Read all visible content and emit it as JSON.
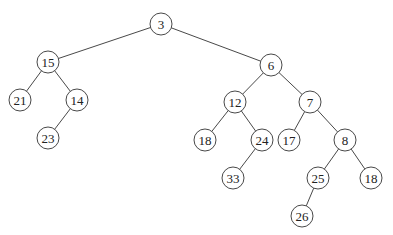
{
  "diagram": {
    "type": "binary-tree",
    "node_radius": 11,
    "nodes": [
      {
        "id": "n3",
        "label": "3",
        "x": 161,
        "y": 24
      },
      {
        "id": "n15",
        "label": "15",
        "x": 48,
        "y": 62
      },
      {
        "id": "n6",
        "label": "6",
        "x": 271,
        "y": 65
      },
      {
        "id": "n21",
        "label": "21",
        "x": 20,
        "y": 100
      },
      {
        "id": "n14",
        "label": "14",
        "x": 77,
        "y": 100
      },
      {
        "id": "n23",
        "label": "23",
        "x": 48,
        "y": 138
      },
      {
        "id": "n12",
        "label": "12",
        "x": 235,
        "y": 102
      },
      {
        "id": "n7",
        "label": "7",
        "x": 310,
        "y": 102
      },
      {
        "id": "n18a",
        "label": "18",
        "x": 205,
        "y": 140
      },
      {
        "id": "n24",
        "label": "24",
        "x": 262,
        "y": 140
      },
      {
        "id": "n17",
        "label": "17",
        "x": 289,
        "y": 140
      },
      {
        "id": "n8",
        "label": "8",
        "x": 345,
        "y": 140
      },
      {
        "id": "n33",
        "label": "33",
        "x": 233,
        "y": 178
      },
      {
        "id": "n25",
        "label": "25",
        "x": 318,
        "y": 178
      },
      {
        "id": "n18b",
        "label": "18",
        "x": 371,
        "y": 178
      },
      {
        "id": "n26",
        "label": "26",
        "x": 302,
        "y": 216
      }
    ],
    "edges": [
      [
        "n3",
        "n15"
      ],
      [
        "n3",
        "n6"
      ],
      [
        "n15",
        "n21"
      ],
      [
        "n15",
        "n14"
      ],
      [
        "n14",
        "n23"
      ],
      [
        "n6",
        "n12"
      ],
      [
        "n6",
        "n7"
      ],
      [
        "n12",
        "n18a"
      ],
      [
        "n12",
        "n24"
      ],
      [
        "n24",
        "n33"
      ],
      [
        "n7",
        "n17"
      ],
      [
        "n7",
        "n8"
      ],
      [
        "n8",
        "n25"
      ],
      [
        "n8",
        "n18b"
      ],
      [
        "n25",
        "n26"
      ]
    ]
  }
}
